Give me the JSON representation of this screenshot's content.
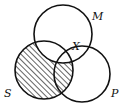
{
  "diagram": {
    "type": "venn",
    "sets": [
      {
        "id": "M",
        "label": "M",
        "cx": 63,
        "cy": 34,
        "r": 29
      },
      {
        "id": "S",
        "label": "S",
        "cx": 44,
        "cy": 70,
        "r": 29
      },
      {
        "id": "P",
        "label": "P",
        "cx": 82,
        "cy": 74,
        "r": 28
      }
    ],
    "point_label": "X",
    "shaded_region": "S minus M",
    "colors": {
      "stroke": "#111111",
      "hatch": "#111111",
      "background": "#ffffff"
    }
  }
}
